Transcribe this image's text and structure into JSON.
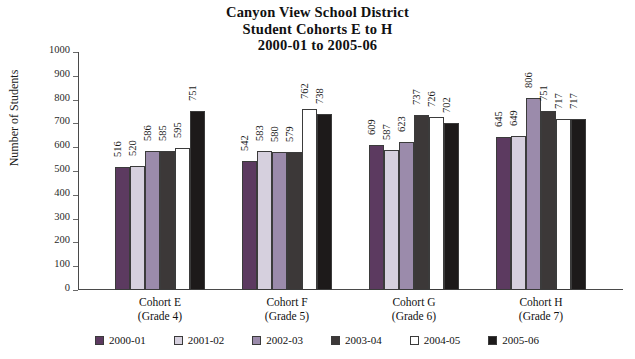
{
  "chart_data": {
    "type": "bar",
    "title": "Canyon View School District Student Cohorts E to H 2000-01 to 2005-06",
    "title_lines": [
      "Canyon View School District",
      "Student Cohorts E to H",
      "2000-01 to 2005-06"
    ],
    "xlabel": "",
    "ylabel": "Number of Students",
    "ylim": [
      0,
      1000
    ],
    "ytick_step": 100,
    "yticks": [
      0,
      100,
      200,
      300,
      400,
      500,
      600,
      700,
      800,
      900,
      1000
    ],
    "grid": false,
    "legend_position": "bottom",
    "categories": [
      "Cohort E",
      "Cohort F",
      "Cohort G",
      "Cohort H"
    ],
    "category_sublabels": [
      "(Grade 4)",
      "(Grade 5)",
      "(Grade 6)",
      "(Grade 7)"
    ],
    "series": [
      {
        "name": "2000-01",
        "color": "#5c3a60",
        "values": [
          516,
          542,
          609,
          645
        ]
      },
      {
        "name": "2001-02",
        "color": "#d6d0de",
        "values": [
          520,
          583,
          587,
          649
        ]
      },
      {
        "name": "2002-03",
        "color": "#9b8bab",
        "values": [
          586,
          580,
          623,
          806
        ]
      },
      {
        "name": "2003-04",
        "color": "#3c3838",
        "values": [
          585,
          579,
          737,
          751
        ]
      },
      {
        "name": "2004-05",
        "color": "#ffffff",
        "values": [
          595,
          762,
          726,
          717
        ]
      },
      {
        "name": "2005-06",
        "color": "#1d1a1a",
        "values": [
          751,
          738,
          702,
          717
        ]
      }
    ]
  }
}
